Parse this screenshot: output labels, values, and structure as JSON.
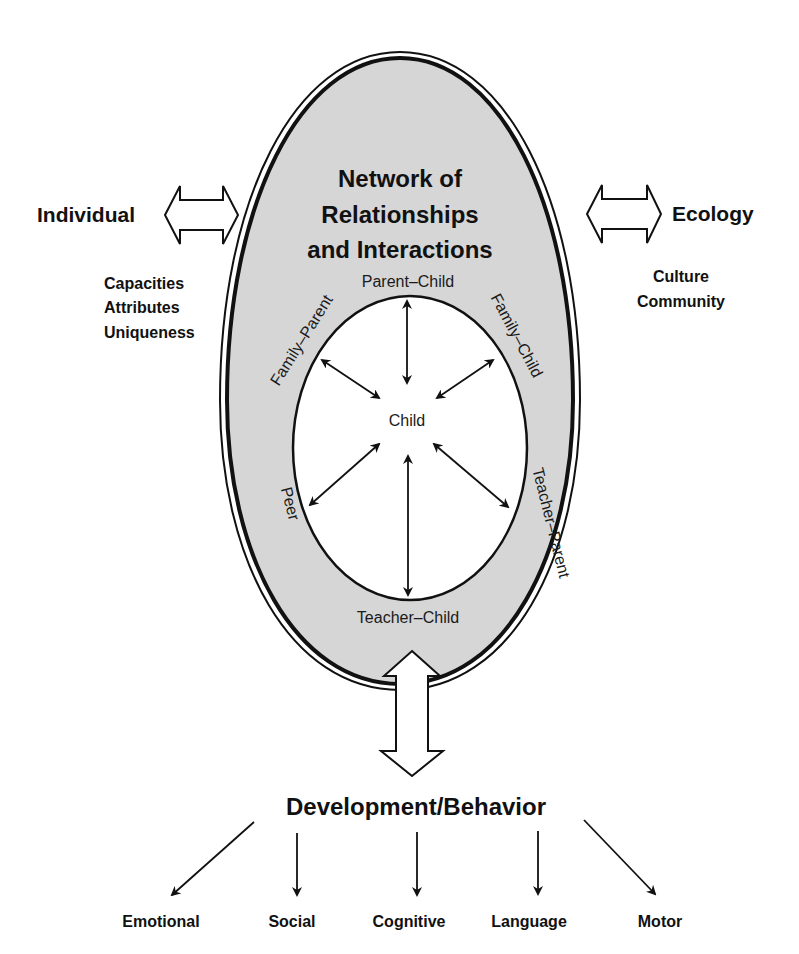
{
  "diagram": {
    "center": {
      "title_lines": [
        "Network of",
        "Relationships",
        "and Interactions"
      ],
      "core": "Child",
      "relationships": {
        "top": "Parent–Child",
        "upper_left": "Family–Parent",
        "upper_right": "Family–Child",
        "lower_left": "Peer",
        "lower_right": "Teacher–Parent",
        "bottom": "Teacher–Child"
      }
    },
    "left": {
      "label": "Individual",
      "attributes": [
        "Capacities",
        "Attributes",
        "Uniqueness"
      ]
    },
    "right": {
      "label": "Ecology",
      "attributes": [
        "Culture",
        "Community"
      ]
    },
    "outcome": {
      "label": "Development/Behavior",
      "domains": [
        "Emotional",
        "Social",
        "Cognitive",
        "Language",
        "Motor"
      ]
    },
    "colors": {
      "oval_fill": "#d6d6d6",
      "inner_fill": "#ffffff",
      "stroke": "#111111"
    }
  }
}
